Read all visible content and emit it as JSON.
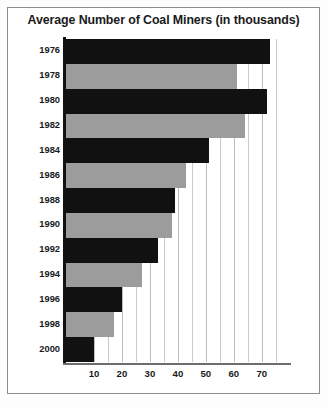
{
  "chart_data": {
    "type": "bar",
    "orientation": "horizontal",
    "title": "Average Number of Coal Miners (in thousands)",
    "xlabel": "",
    "ylabel": "",
    "categories": [
      "1976",
      "1978",
      "1980",
      "1982",
      "1984",
      "1986",
      "1988",
      "1990",
      "1992",
      "1994",
      "1996",
      "1998",
      "2000"
    ],
    "values": [
      73,
      61,
      72,
      64,
      51,
      43,
      39,
      38,
      33,
      27,
      20,
      17,
      10
    ],
    "series": [
      {
        "name": "Average Number of Coal Miners (in thousands)",
        "values": [
          73,
          61,
          72,
          64,
          51,
          43,
          39,
          38,
          33,
          27,
          20,
          17,
          10
        ]
      }
    ],
    "bar_colors": [
      "#111111",
      "#9c9c9c",
      "#111111",
      "#9c9c9c",
      "#111111",
      "#9c9c9c",
      "#111111",
      "#9c9c9c",
      "#111111",
      "#9c9c9c",
      "#111111",
      "#9c9c9c",
      "#111111"
    ],
    "xticks": [
      10,
      20,
      30,
      40,
      50,
      60,
      70
    ],
    "xtick_labels": [
      "10",
      "20",
      "30",
      "40",
      "50",
      "60",
      "70"
    ],
    "xlim": [
      0,
      79
    ],
    "gridlines": [
      5,
      10,
      15,
      20,
      25,
      30,
      35,
      40,
      45,
      50,
      55,
      60,
      65,
      70,
      75
    ],
    "grid": true,
    "legend": null,
    "colors": {
      "bar_dark": "#111111",
      "bar_light": "#9c9c9c",
      "grid": "#c9c9c9",
      "axis": "#111111",
      "frame": "#8e8e8e",
      "background": "#ffffff",
      "text": "#1a1a1a"
    }
  }
}
